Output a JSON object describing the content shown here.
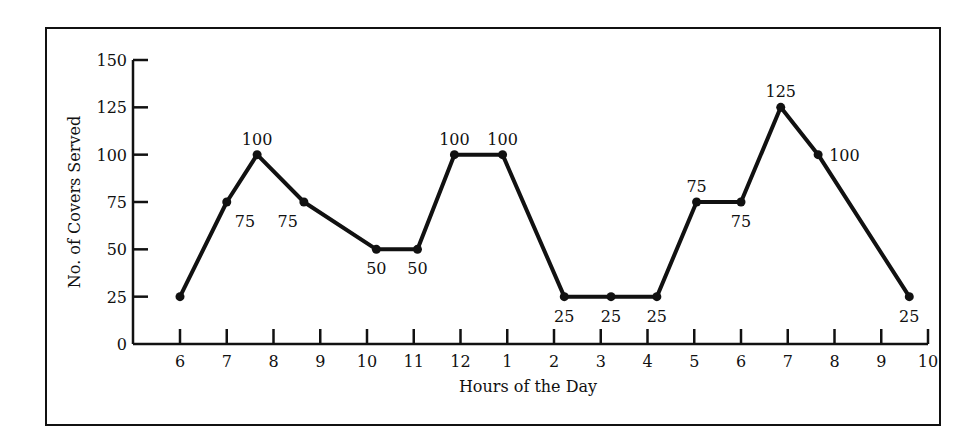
{
  "chart_data": {
    "type": "line",
    "title": "",
    "xlabel": "Hours of the Day",
    "ylabel": "No. of Covers Served",
    "ylim": [
      0,
      150
    ],
    "yticks": [
      0,
      25,
      50,
      75,
      100,
      125,
      150
    ],
    "xticks": [
      "6",
      "7",
      "8",
      "9",
      "10",
      "11",
      "12",
      "1",
      "2",
      "3",
      "4",
      "5",
      "6",
      "7",
      "8",
      "9",
      "10"
    ],
    "grid": false,
    "legend": null,
    "series": [
      {
        "name": "Covers Served",
        "points": [
          {
            "x": 0.0,
            "y": 25,
            "label": "",
            "label_pos": "none"
          },
          {
            "x": 1.0,
            "y": 75,
            "label": "75",
            "label_pos": "below-right"
          },
          {
            "x": 1.65,
            "y": 100,
            "label": "100",
            "label_pos": "above"
          },
          {
            "x": 2.65,
            "y": 75,
            "label": "75",
            "label_pos": "below-left"
          },
          {
            "x": 4.2,
            "y": 50,
            "label": "50",
            "label_pos": "below"
          },
          {
            "x": 5.08,
            "y": 50,
            "label": "50",
            "label_pos": "below"
          },
          {
            "x": 5.87,
            "y": 100,
            "label": "100",
            "label_pos": "above"
          },
          {
            "x": 6.9,
            "y": 100,
            "label": "100",
            "label_pos": "above"
          },
          {
            "x": 8.22,
            "y": 25,
            "label": "25",
            "label_pos": "below"
          },
          {
            "x": 9.22,
            "y": 25,
            "label": "25",
            "label_pos": "below"
          },
          {
            "x": 10.2,
            "y": 25,
            "label": "25",
            "label_pos": "below"
          },
          {
            "x": 11.05,
            "y": 75,
            "label": "75",
            "label_pos": "above"
          },
          {
            "x": 12.0,
            "y": 75,
            "label": "75",
            "label_pos": "below"
          },
          {
            "x": 12.85,
            "y": 125,
            "label": "125",
            "label_pos": "above"
          },
          {
            "x": 13.65,
            "y": 100,
            "label": "100",
            "label_pos": "right"
          },
          {
            "x": 15.6,
            "y": 25,
            "label": "25",
            "label_pos": "below"
          }
        ]
      }
    ]
  }
}
